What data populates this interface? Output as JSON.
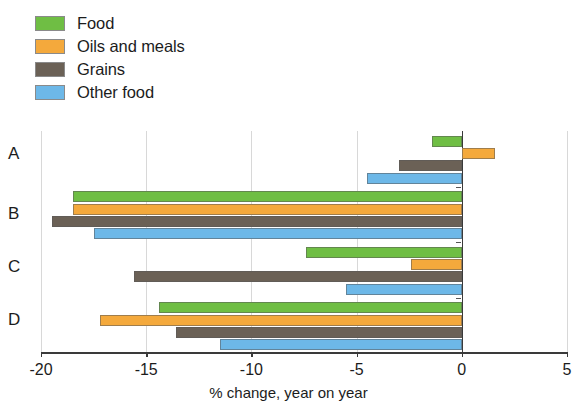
{
  "legend": {
    "position": "top-left",
    "items": [
      {
        "label": "Food",
        "color": "#6FBE44"
      },
      {
        "label": "Oils and meals",
        "color": "#F4A93C"
      },
      {
        "label": "Grains",
        "color": "#6B6156"
      },
      {
        "label": "Other food",
        "color": "#6DB8E8"
      }
    ]
  },
  "axis": {
    "xlabel": "% change, year on year",
    "ticks": [
      "-20",
      "-15",
      "-10",
      "-5",
      "0",
      "5"
    ],
    "categories": [
      "A",
      "B",
      "C",
      "D"
    ]
  },
  "chart_data": {
    "type": "bar",
    "orientation": "horizontal",
    "title": "",
    "subtitle": "",
    "xlabel": "% change, year on year",
    "ylabel": "",
    "xlim": [
      -20,
      5
    ],
    "xticks": [
      -20,
      -15,
      -10,
      -5,
      0,
      5
    ],
    "grid": true,
    "legend_position": "top-left",
    "categories": [
      "A",
      "B",
      "C",
      "D"
    ],
    "series": [
      {
        "name": "Food",
        "color": "#6FBE44",
        "values": [
          -1.4,
          -18.5,
          -7.4,
          -14.4
        ]
      },
      {
        "name": "Oils and meals",
        "color": "#F4A93C",
        "values": [
          1.6,
          -18.5,
          -2.4,
          -17.2
        ]
      },
      {
        "name": "Grains",
        "color": "#6B6156",
        "values": [
          -3.0,
          -19.5,
          -15.6,
          -13.6
        ]
      },
      {
        "name": "Other food",
        "color": "#6DB8E8",
        "values": [
          -4.5,
          -17.5,
          -5.5,
          -11.5
        ]
      }
    ]
  }
}
